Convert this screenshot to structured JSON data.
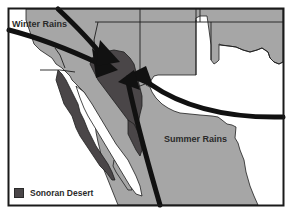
{
  "map": {
    "title": "",
    "labels": {
      "winter_rains": "Winter Rains",
      "summer_rains": "Summer Rains"
    },
    "legend": {
      "items": [
        {
          "label": "Sonoran Desert",
          "color": "#4a4648"
        }
      ]
    },
    "colors": {
      "land": "#a6a6a6",
      "desert": "#4a4648",
      "ocean": "#ffffff",
      "borders": "#1e1e1e",
      "arrows": "#111111",
      "frame": "#1a1a1a"
    },
    "arrows": [
      {
        "name": "winter-rains-arrow-west",
        "direction": "from west/northwest toward Sonoran Desert"
      },
      {
        "name": "winter-rains-arrow-north",
        "direction": "from north toward Sonoran Desert"
      },
      {
        "name": "summer-rains-arrow-east",
        "direction": "from east toward Sonoran Desert"
      },
      {
        "name": "summer-rains-arrow-south",
        "direction": "from south toward Sonoran Desert"
      }
    ]
  }
}
